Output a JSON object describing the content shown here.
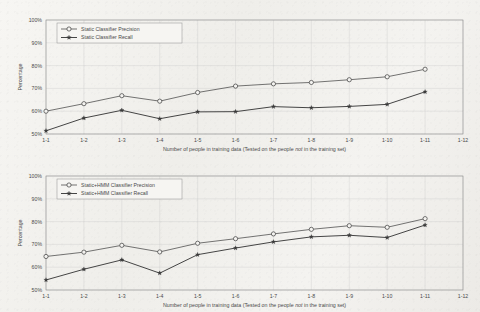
{
  "figure": {
    "background_color": "#f2f1ee",
    "line_color": "#3b3b3b",
    "grid_color": "#c9c9c9",
    "frame_color": "#8f8f8f"
  },
  "axis": {
    "y_label": "Percentage",
    "y_ticks": [
      "50%",
      "60%",
      "70%",
      "80%",
      "90%",
      "100%"
    ],
    "y_min": 50,
    "y_max": 100,
    "x_ticks": [
      "1-1",
      "1-2",
      "1-3",
      "1-4",
      "1-5",
      "1-6",
      "1-7",
      "1-8",
      "1-9",
      "1-10",
      "1-11",
      "1-12"
    ],
    "x_label_part1": "Number of people in training data (Tested on the people ",
    "x_label_italic": "not",
    "x_label_part2": " in the training set)"
  },
  "chart_data": [
    {
      "type": "line",
      "id": "static-classifier",
      "title": "",
      "xlabel": "Number of people in training data (Tested on the people not in the training set)",
      "ylabel": "Percentage",
      "ylim": [
        50,
        100
      ],
      "grid": true,
      "legend_position": "top-left",
      "categories": [
        "1-1",
        "1-2",
        "1-3",
        "1-4",
        "1-5",
        "1-6",
        "1-7",
        "1-8",
        "1-9",
        "1-10",
        "1-11"
      ],
      "x_axis_extra_ticks": [
        "1-12"
      ],
      "series": [
        {
          "name": "Static Classifier Precision",
          "marker": "circle-open",
          "values": [
            60.0,
            63.3,
            66.8,
            64.4,
            68.2,
            71.0,
            72.0,
            72.6,
            73.8,
            75.1,
            78.4
          ]
        },
        {
          "name": "Static Classifier Recall",
          "marker": "star-filled",
          "values": [
            51.4,
            57.0,
            60.4,
            56.7,
            59.7,
            59.8,
            62.0,
            61.5,
            62.1,
            63.0,
            68.5
          ]
        }
      ]
    },
    {
      "type": "line",
      "id": "static-hmm-classifier",
      "title": "",
      "xlabel": "Number of people in training data (Tested on the people not in the training set)",
      "ylabel": "Percentage",
      "ylim": [
        50,
        100
      ],
      "grid": true,
      "legend_position": "top-left",
      "categories": [
        "1-1",
        "1-2",
        "1-3",
        "1-4",
        "1-5",
        "1-6",
        "1-7",
        "1-8",
        "1-9",
        "1-10",
        "1-11"
      ],
      "x_axis_extra_ticks": [
        "1-12"
      ],
      "series": [
        {
          "name": "Static+HMM Classifier Precision",
          "marker": "circle-open",
          "values": [
            64.7,
            66.6,
            69.6,
            66.7,
            70.5,
            72.5,
            74.6,
            76.6,
            78.2,
            77.5,
            81.3
          ]
        },
        {
          "name": "Static+HMM Classifier Recall",
          "marker": "star-filled",
          "values": [
            54.4,
            59.1,
            63.2,
            57.4,
            65.5,
            68.4,
            71.1,
            73.3,
            74.0,
            73.0,
            78.5
          ]
        }
      ]
    }
  ]
}
